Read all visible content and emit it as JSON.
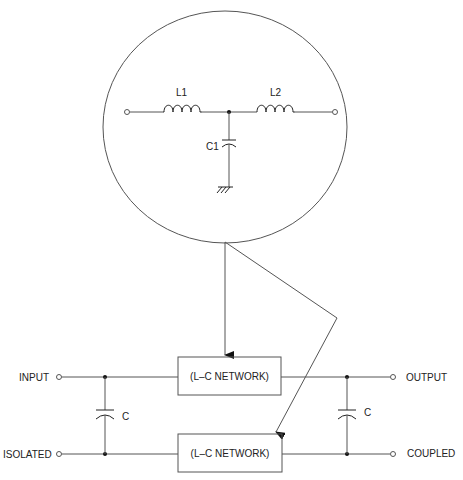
{
  "detail": {
    "inductor_1": "L1",
    "inductor_2": "L2",
    "capacitor": "C1"
  },
  "network": {
    "upper_box": "(L–C NETWORK)",
    "lower_box": "(L–C NETWORK)"
  },
  "ports": {
    "input": "INPUT",
    "isolated": "ISOLATED",
    "output": "OUTPUT",
    "coupled": "COUPLED"
  },
  "capacitors": {
    "left": "C",
    "right": "C"
  }
}
